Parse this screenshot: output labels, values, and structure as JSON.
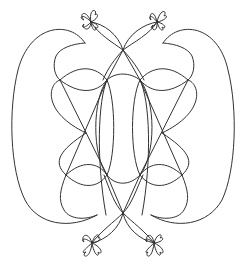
{
  "figure": {
    "stroke_color": "#333333",
    "background": "#ffffff",
    "stroke_width": 1
  },
  "elements": {
    "flowers": [
      {
        "name": "top-left",
        "cx": 91,
        "cy": 22
      },
      {
        "name": "top-right",
        "cx": 157,
        "cy": 22
      },
      {
        "name": "bottom-left",
        "cx": 92,
        "cy": 243
      },
      {
        "name": "bottom-right",
        "cx": 154,
        "cy": 243
      }
    ],
    "crossings": [
      {
        "name": "top-center",
        "x": 123,
        "y": 50
      },
      {
        "name": "bottom-center",
        "x": 123,
        "y": 213
      }
    ]
  }
}
